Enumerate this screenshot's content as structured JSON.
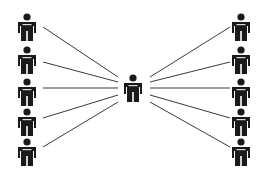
{
  "diagram": {
    "type": "hub-and-spoke",
    "colors": {
      "figure": "#1a1a1a",
      "line": "#3a3a3a",
      "background": "#ffffff",
      "shirt_detail": "#d8d8d8"
    },
    "hub": {
      "id": "center",
      "x": 133,
      "y": 88
    },
    "left_nodes": [
      {
        "id": "L1",
        "x": 27,
        "y": 27
      },
      {
        "id": "L2",
        "x": 27,
        "y": 60
      },
      {
        "id": "L3",
        "x": 27,
        "y": 92
      },
      {
        "id": "L4",
        "x": 27,
        "y": 122
      },
      {
        "id": "L5",
        "x": 27,
        "y": 152
      }
    ],
    "right_nodes": [
      {
        "id": "R1",
        "x": 241,
        "y": 27
      },
      {
        "id": "R2",
        "x": 241,
        "y": 60
      },
      {
        "id": "R3",
        "x": 241,
        "y": 92
      },
      {
        "id": "R4",
        "x": 241,
        "y": 122
      },
      {
        "id": "R5",
        "x": 241,
        "y": 152
      }
    ],
    "edges_left": [
      {
        "x1": 43,
        "y1": 27,
        "x2": 118,
        "y2": 77
      },
      {
        "x1": 43,
        "y1": 62,
        "x2": 118,
        "y2": 82
      },
      {
        "x1": 43,
        "y1": 88,
        "x2": 118,
        "y2": 88
      },
      {
        "x1": 43,
        "y1": 118,
        "x2": 118,
        "y2": 95
      },
      {
        "x1": 43,
        "y1": 147,
        "x2": 118,
        "y2": 102
      }
    ],
    "edges_right": [
      {
        "x1": 150,
        "y1": 77,
        "x2": 230,
        "y2": 27
      },
      {
        "x1": 150,
        "y1": 82,
        "x2": 230,
        "y2": 62
      },
      {
        "x1": 150,
        "y1": 88,
        "x2": 230,
        "y2": 88
      },
      {
        "x1": 150,
        "y1": 95,
        "x2": 230,
        "y2": 118
      },
      {
        "x1": 150,
        "y1": 102,
        "x2": 230,
        "y2": 147
      }
    ]
  }
}
